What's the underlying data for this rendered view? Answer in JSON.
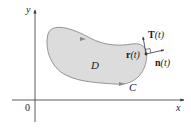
{
  "diagram": {
    "axes": {
      "x_label": "x",
      "y_label": "y",
      "origin_label": "0"
    },
    "region": {
      "label": "D",
      "fill": "#dcdcdc",
      "stroke": "#8a8a8a"
    },
    "curve": {
      "label": "C",
      "orientation": "counterclockwise"
    },
    "point": {
      "label_bold": "r",
      "label_arg": "(t)"
    },
    "tangent_vector": {
      "label_bold": "T",
      "label_arg": "(t)"
    },
    "normal_vector": {
      "label_bold": "n",
      "label_arg": "(t)"
    },
    "colors": {
      "axis": "#333333",
      "text": "#1a1a1a",
      "vector": "#333333"
    }
  }
}
